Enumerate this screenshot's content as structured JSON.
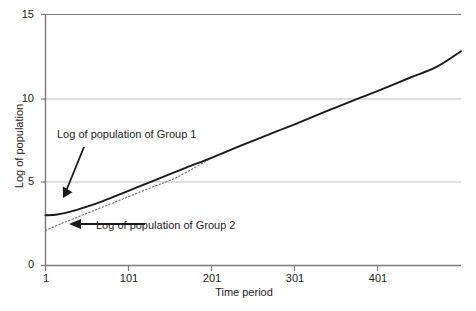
{
  "chart_data": {
    "type": "line",
    "title": "",
    "xlabel": "Time period",
    "ylabel": "Log of population",
    "xlim": [
      1,
      500
    ],
    "ylim": [
      0,
      15
    ],
    "grid": true,
    "gridlines_y": [
      5,
      10,
      15
    ],
    "legend": "none",
    "xticks": [
      "1",
      "101",
      "201",
      "301",
      "401"
    ],
    "xtick_values": [
      1,
      101,
      201,
      301,
      401
    ],
    "yticks": [
      "0",
      "5",
      "10",
      "15"
    ],
    "ytick_values": [
      0,
      5,
      10,
      15
    ],
    "series": [
      {
        "name": "Log of population of Group 1",
        "style": "solid",
        "color": "#1a1a1a",
        "x": [
          1,
          15,
          30,
          50,
          70,
          90,
          110,
          140,
          170,
          201,
          240,
          280,
          301,
          340,
          380,
          401,
          440,
          470,
          500
        ],
        "values": [
          3.0,
          3.05,
          3.2,
          3.5,
          3.85,
          4.25,
          4.65,
          5.25,
          5.85,
          6.45,
          7.25,
          8.05,
          8.45,
          9.25,
          10.05,
          10.45,
          11.25,
          11.85,
          12.8
        ]
      },
      {
        "name": "Log of population of Group 2",
        "style": "dotted",
        "color": "#6b6b6b",
        "x": [
          1,
          20,
          40,
          60,
          80,
          100,
          130,
          160,
          201
        ],
        "values": [
          2.1,
          2.5,
          2.9,
          3.3,
          3.7,
          4.1,
          4.7,
          5.3,
          6.45
        ]
      }
    ],
    "annotations": [
      {
        "id": "group-1",
        "text": "Log of population of Group 1",
        "arrow_from": [
          84,
          147
        ],
        "arrow_to": [
          63,
          198
        ]
      },
      {
        "id": "group-2",
        "text": "Log of population of Group 2",
        "arrow_from": [
          145,
          224
        ],
        "arrow_to": [
          70,
          224
        ]
      }
    ]
  }
}
